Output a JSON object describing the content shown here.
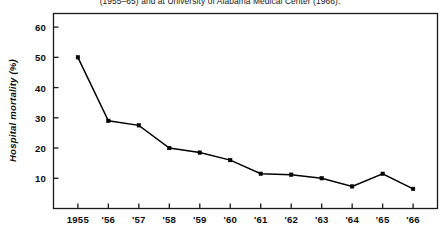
{
  "caption": "(1955–65) and at University of Alabama Medical Center (1966).",
  "chart_data": {
    "type": "line",
    "title": "(1955–65) and at University of Alabama Medical Center (1966).",
    "xlabel": "",
    "ylabel": "Hospital mortality (%)",
    "categories": [
      "1955",
      "'56",
      "'57",
      "'58",
      "'59",
      "'60",
      "'61",
      "'62",
      "'63",
      "'64",
      "'65",
      "'66"
    ],
    "x": [
      1955,
      1956,
      1957,
      1958,
      1959,
      1960,
      1961,
      1962,
      1963,
      1964,
      1965,
      1966
    ],
    "values": [
      50,
      29,
      27.5,
      20,
      18.5,
      16,
      11.5,
      11.2,
      10,
      7.3,
      11.5,
      6.5
    ],
    "xlim": [
      1954.2,
      1966.8
    ],
    "ylim": [
      0,
      64.5
    ],
    "yticks": [
      10,
      20,
      30,
      40,
      50,
      60
    ],
    "ytick_labels": [
      "10",
      "20",
      "30",
      "40",
      "50",
      "60"
    ],
    "xticks": [
      1955,
      1956,
      1957,
      1958,
      1959,
      1960,
      1961,
      1962,
      1963,
      1964,
      1965,
      1966
    ],
    "xtick_labels": [
      "1955",
      "'56",
      "'57",
      "'58",
      "'59",
      "'60",
      "'61",
      "'62",
      "'63",
      "'64",
      "'65",
      "'66"
    ],
    "grid": false,
    "legend": false,
    "marker": "square",
    "line_color": "#000000",
    "marker_color": "#000000",
    "frame_color": "#1a1a1a"
  }
}
